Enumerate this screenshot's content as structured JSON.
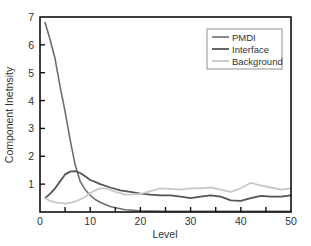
{
  "chart_data": {
    "type": "line",
    "title": "",
    "xlabel": "Level",
    "ylabel": "Component Inetnsity",
    "xlim": [
      0,
      50
    ],
    "ylim": [
      0,
      7
    ],
    "xticks": [
      0,
      10,
      20,
      30,
      40,
      50
    ],
    "xminor_ticks": [
      5,
      15,
      25,
      35,
      45
    ],
    "yticks": [
      1,
      2,
      3,
      4,
      5,
      6,
      7
    ],
    "grid": false,
    "legend_position": "upper right",
    "series": [
      {
        "name": "PMDI",
        "color": "#6e6e6e",
        "width": 1.6,
        "x": [
          1,
          2,
          3,
          4,
          5,
          6,
          7,
          8,
          9,
          10,
          11,
          12,
          13,
          14,
          15,
          17,
          20,
          25,
          30,
          35,
          40,
          45,
          50
        ],
        "y": [
          6.8,
          6.2,
          5.5,
          4.5,
          3.6,
          2.6,
          1.7,
          1.1,
          0.8,
          0.6,
          0.45,
          0.35,
          0.27,
          0.2,
          0.15,
          0.08,
          0.04,
          0.02,
          0.02,
          0.02,
          0.02,
          0.02,
          0.02
        ]
      },
      {
        "name": "Interface",
        "color": "#555555",
        "width": 1.8,
        "x": [
          1,
          2,
          3,
          4,
          5,
          6,
          7,
          8,
          9,
          10,
          11,
          12,
          14,
          16,
          18,
          20,
          22,
          24,
          26,
          28,
          30,
          32,
          34,
          36,
          38,
          40,
          42,
          44,
          46,
          48,
          50
        ],
        "y": [
          0.5,
          0.65,
          0.85,
          1.1,
          1.35,
          1.45,
          1.47,
          1.4,
          1.28,
          1.15,
          1.08,
          1.0,
          0.88,
          0.78,
          0.72,
          0.66,
          0.62,
          0.6,
          0.6,
          0.55,
          0.5,
          0.55,
          0.6,
          0.55,
          0.42,
          0.4,
          0.5,
          0.58,
          0.55,
          0.55,
          0.6
        ]
      },
      {
        "name": "Background",
        "color": "#c8c8c8",
        "width": 1.8,
        "x": [
          1,
          2,
          3,
          4,
          5,
          6,
          7,
          8,
          9,
          10,
          11,
          12,
          13,
          14,
          15,
          16,
          17,
          18,
          20,
          22,
          24,
          26,
          28,
          30,
          32,
          34,
          36,
          38,
          40,
          42,
          44,
          46,
          48,
          50
        ],
        "y": [
          0.5,
          0.4,
          0.35,
          0.33,
          0.3,
          0.33,
          0.38,
          0.45,
          0.55,
          0.68,
          0.78,
          0.85,
          0.85,
          0.8,
          0.72,
          0.68,
          0.62,
          0.62,
          0.65,
          0.75,
          0.85,
          0.83,
          0.8,
          0.85,
          0.85,
          0.88,
          0.8,
          0.72,
          0.85,
          1.05,
          0.95,
          0.88,
          0.8,
          0.85
        ]
      }
    ]
  }
}
